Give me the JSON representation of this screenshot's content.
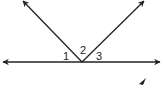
{
  "diagram": {
    "type": "angles on a line",
    "labels": [
      {
        "text": "1",
        "x": 63,
        "y": 51
      },
      {
        "text": "2",
        "x": 80,
        "y": 45
      },
      {
        "text": "3",
        "x": 96,
        "y": 51
      }
    ],
    "colors": {
      "line": "#222222",
      "background": "#ffffff"
    }
  }
}
